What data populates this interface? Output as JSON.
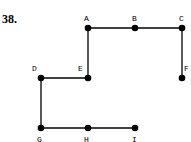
{
  "problem_number": "38.",
  "nodes": [
    {
      "id": "A",
      "x": 88,
      "y": 28,
      "label_dx": -4,
      "label_dy": -7
    },
    {
      "id": "B",
      "x": 135,
      "y": 28,
      "label_dx": -3,
      "label_dy": -7
    },
    {
      "id": "C",
      "x": 182,
      "y": 28,
      "label_dx": -3,
      "label_dy": -7
    },
    {
      "id": "D",
      "x": 41,
      "y": 78,
      "label_dx": -9,
      "label_dy": -7
    },
    {
      "id": "E",
      "x": 88,
      "y": 78,
      "label_dx": -10,
      "label_dy": -7
    },
    {
      "id": "F",
      "x": 182,
      "y": 78,
      "label_dx": 2,
      "label_dy": -7
    },
    {
      "id": "G",
      "x": 41,
      "y": 128,
      "label_dx": -4,
      "label_dy": 14
    },
    {
      "id": "H",
      "x": 88,
      "y": 128,
      "label_dx": -4,
      "label_dy": 14
    },
    {
      "id": "I",
      "x": 135,
      "y": 128,
      "label_dx": -3,
      "label_dy": 14
    }
  ],
  "edges": [
    [
      "A",
      "B"
    ],
    [
      "B",
      "C"
    ],
    [
      "C",
      "F"
    ],
    [
      "A",
      "E"
    ],
    [
      "E",
      "D"
    ],
    [
      "D",
      "G"
    ],
    [
      "G",
      "H"
    ],
    [
      "H",
      "I"
    ]
  ]
}
